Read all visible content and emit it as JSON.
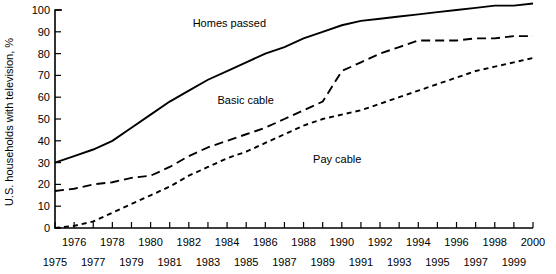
{
  "chart_data": {
    "type": "line",
    "title": "",
    "xlabel": "",
    "ylabel": "U.S. households with television, %",
    "xlim": [
      1975,
      2000
    ],
    "ylim": [
      0,
      100
    ],
    "grid": false,
    "legend_position": "inline-annotations",
    "x": [
      1975,
      1976,
      1977,
      1978,
      1979,
      1980,
      1981,
      1982,
      1983,
      1984,
      1985,
      1986,
      1987,
      1988,
      1989,
      1990,
      1991,
      1992,
      1993,
      1994,
      1995,
      1996,
      1997,
      1998,
      1999,
      2000
    ],
    "yticks": [
      0,
      10,
      20,
      30,
      40,
      50,
      60,
      70,
      80,
      90,
      100
    ],
    "xticks_upper_row": [
      1976,
      1978,
      1980,
      1982,
      1984,
      1986,
      1988,
      1990,
      1992,
      1994,
      1996,
      1998,
      2000
    ],
    "xticks_lower_row": [
      1975,
      1977,
      1979,
      1981,
      1983,
      1985,
      1987,
      1989,
      1991,
      1993,
      1995,
      1997,
      1999
    ],
    "series": [
      {
        "name": "Homes passed",
        "style": "solid",
        "label_x": 1982.2,
        "label_y": 92,
        "values": [
          30,
          33,
          36,
          40,
          46,
          52,
          58,
          63,
          68,
          72,
          76,
          80,
          83,
          87,
          90,
          93,
          95,
          96,
          97,
          98,
          99,
          100,
          101,
          102,
          102,
          103
        ]
      },
      {
        "name": "Basic cable",
        "style": "dashed",
        "label_x": 1983.5,
        "label_y": 57,
        "values": [
          17,
          18,
          20,
          21,
          23,
          24,
          28,
          33,
          37,
          40,
          43,
          46,
          50,
          54,
          58,
          72,
          76,
          80,
          83,
          86,
          86,
          86,
          87,
          87,
          88,
          88
        ]
      },
      {
        "name": "Pay cable",
        "style": "dotted",
        "label_x": 1988.5,
        "label_y": 30,
        "values": [
          0,
          1,
          3,
          7,
          11,
          15,
          19,
          24,
          28,
          32,
          35,
          39,
          43,
          47,
          50,
          52,
          54,
          57,
          60,
          63,
          66,
          69,
          72,
          74,
          76,
          78
        ]
      }
    ]
  }
}
